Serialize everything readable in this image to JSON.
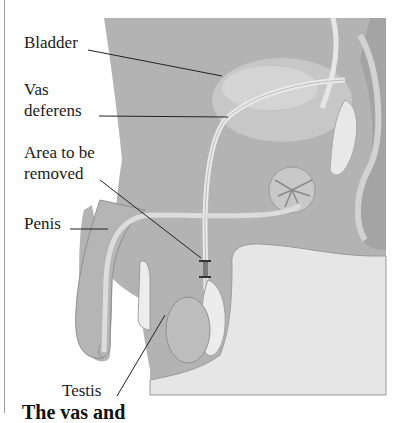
{
  "figure": {
    "labels": {
      "bladder": "Bladder",
      "vas_line1": "Vas",
      "vas_line2": "deferens",
      "area_line1": "Area to be",
      "area_line2": "removed",
      "penis": "Penis",
      "testis": "Testis"
    },
    "caption_partial": "The vas and",
    "colors": {
      "body_gray": "#b3b3b3",
      "dark_gray": "#9c9c9c",
      "light_gray": "#dadada",
      "leg_fill": "#e6e6e6",
      "tube": "#e9e9e9"
    }
  }
}
